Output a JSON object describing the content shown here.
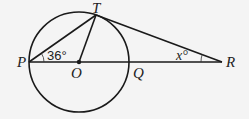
{
  "diagram": {
    "type": "geometry",
    "points": {
      "P": {
        "label": "P"
      },
      "O": {
        "label": "O"
      },
      "Q": {
        "label": "Q"
      },
      "R": {
        "label": "R"
      },
      "T": {
        "label": "T"
      }
    },
    "angles": {
      "TPO": {
        "label": "36°",
        "vertex": "P"
      },
      "TRP": {
        "label": "x°",
        "vertex": "R"
      }
    },
    "colors": {
      "background": "#f4f4f4",
      "stroke": "#1a1a1a"
    }
  }
}
